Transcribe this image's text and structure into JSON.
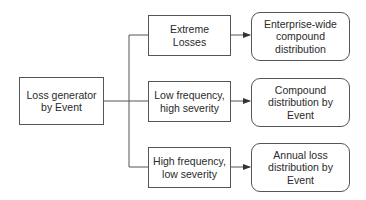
{
  "diagram": {
    "colors": {
      "line": "#555555",
      "text": "#2a2a2a",
      "background": "#ffffff"
    },
    "source": {
      "lines": [
        "Loss generator",
        "by Event"
      ]
    },
    "categories": [
      {
        "lines": [
          "Extreme",
          "Losses"
        ]
      },
      {
        "lines": [
          "Low frequency,",
          "high severity"
        ]
      },
      {
        "lines": [
          "High frequency,",
          "low severity"
        ]
      }
    ],
    "outputs": [
      {
        "lines": [
          "Enterprise-wide",
          "compound",
          "distribution"
        ]
      },
      {
        "lines": [
          "Compound",
          "distribution by",
          "Event"
        ]
      },
      {
        "lines": [
          "Annual loss",
          "distribution by",
          "Event"
        ]
      }
    ]
  }
}
